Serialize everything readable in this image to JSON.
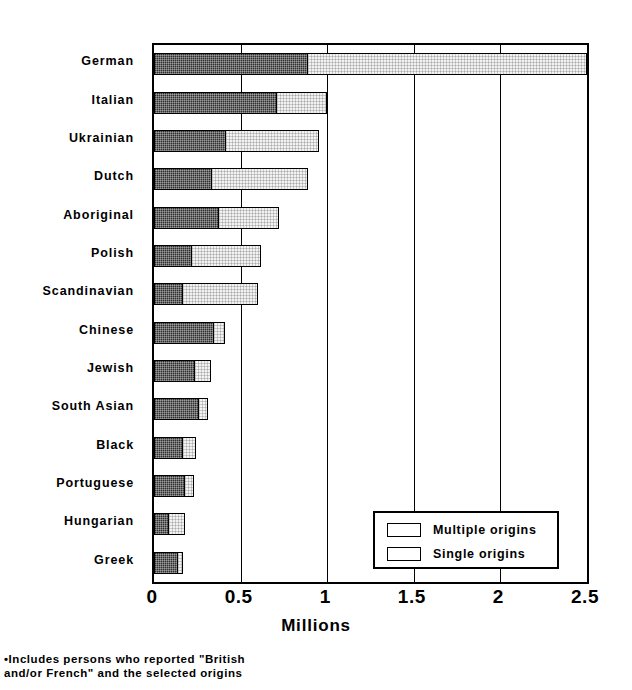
{
  "chart_data": {
    "type": "bar",
    "orientation": "horizontal",
    "stacked": true,
    "title": "",
    "xlabel": "Millions",
    "ylabel": "",
    "xlim": [
      0,
      2.5
    ],
    "xticks": [
      "0",
      "0.5",
      "1",
      "1.5",
      "2",
      "2.5"
    ],
    "xtick_values": [
      0,
      0.5,
      1,
      1.5,
      2,
      2.5
    ],
    "grid": true,
    "grid_axis": "x",
    "legend_position": "bottom-right",
    "categories": [
      "German",
      "Italian",
      "Ukrainian",
      "Dutch",
      "Aboriginal",
      "Polish",
      "Scandinavian",
      "Chinese",
      "Jewish",
      "South Asian",
      "Black",
      "Portuguese",
      "Hungarian",
      "Greek"
    ],
    "series": [
      {
        "name": "Single origins",
        "color": "#2e2e2e",
        "values": [
          0.89,
          0.71,
          0.42,
          0.34,
          0.38,
          0.22,
          0.17,
          0.35,
          0.24,
          0.26,
          0.17,
          0.18,
          0.09,
          0.14
        ]
      },
      {
        "name": "Multiple origins",
        "color": "#f2f2f2",
        "values": [
          1.61,
          0.29,
          0.53,
          0.55,
          0.34,
          0.4,
          0.43,
          0.06,
          0.09,
          0.05,
          0.07,
          0.05,
          0.09,
          0.03
        ]
      }
    ],
    "totals": [
      2.5,
      1.0,
      0.95,
      0.89,
      0.72,
      0.62,
      0.6,
      0.41,
      0.33,
      0.31,
      0.24,
      0.23,
      0.18,
      0.17
    ]
  },
  "legend": {
    "items": [
      {
        "label": "Multiple origins",
        "swatch": "multiple"
      },
      {
        "label": "Single origins",
        "swatch": "single"
      }
    ]
  },
  "footnote": {
    "line1": "•Includes persons who reported \"British",
    "line2": "and/or French\" and the selected origins"
  }
}
